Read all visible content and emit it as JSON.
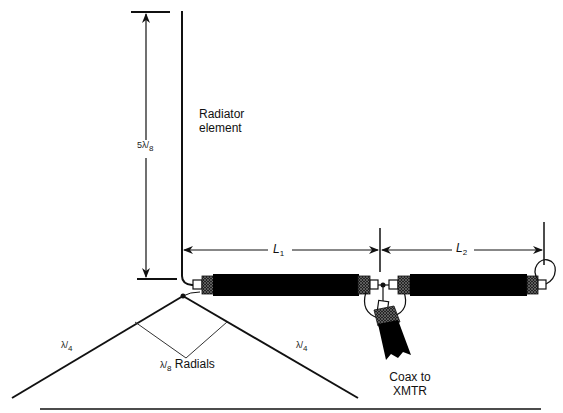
{
  "diagram": {
    "type": "antenna-schematic",
    "labels": {
      "radiator": "Radiator\nelement",
      "radiator_line1": "Radiator",
      "radiator_line2": "element",
      "vertical_dimension": {
        "numerator": "5λ",
        "denominator": "8"
      },
      "l1": {
        "symbol": "L",
        "subscript": "1"
      },
      "l2": {
        "symbol": "L",
        "subscript": "2"
      },
      "radial_left": {
        "numerator": "λ",
        "denominator": "4"
      },
      "radial_right": {
        "numerator": "λ",
        "denominator": "4"
      },
      "radials": {
        "numerator": "λ",
        "denominator": "8",
        "text": "Radials"
      },
      "coax_line1": "Coax to",
      "coax_line2": "XMTR"
    },
    "colors": {
      "line": "#111111",
      "coax_body": "#000000",
      "braid": "#444444",
      "connector": "#ffffff",
      "background": "#ffffff"
    }
  }
}
